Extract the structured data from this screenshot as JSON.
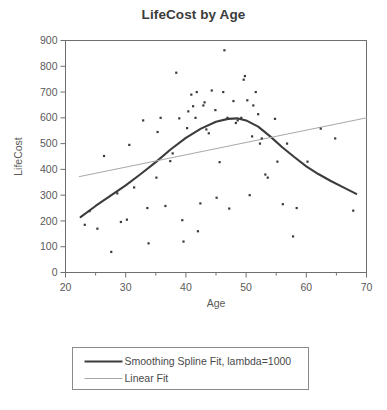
{
  "chart_data": {
    "type": "scatter",
    "title": "LifeCost by Age",
    "xlabel": "Age",
    "ylabel": "LifeCost",
    "xlim": [
      20,
      70
    ],
    "ylim": [
      0,
      900
    ],
    "xticks": [
      20,
      30,
      40,
      50,
      60,
      70
    ],
    "xminorticks": [
      25,
      35,
      45,
      55,
      65
    ],
    "yticks": [
      0,
      100,
      200,
      300,
      400,
      500,
      600,
      700,
      800,
      900
    ],
    "grid": false,
    "legend_position": "below-plot",
    "point_color": "#3a3a3a",
    "frame_color": "#6f6f6f",
    "points": [
      {
        "x": 23.2,
        "y": 185
      },
      {
        "x": 24.0,
        "y": 238
      },
      {
        "x": 25.3,
        "y": 170
      },
      {
        "x": 26.4,
        "y": 452
      },
      {
        "x": 27.6,
        "y": 80
      },
      {
        "x": 28.6,
        "y": 307
      },
      {
        "x": 29.2,
        "y": 196
      },
      {
        "x": 30.2,
        "y": 205
      },
      {
        "x": 30.6,
        "y": 495
      },
      {
        "x": 31.4,
        "y": 330
      },
      {
        "x": 32.9,
        "y": 590
      },
      {
        "x": 33.6,
        "y": 250
      },
      {
        "x": 33.8,
        "y": 113
      },
      {
        "x": 35.1,
        "y": 368
      },
      {
        "x": 35.3,
        "y": 545
      },
      {
        "x": 35.8,
        "y": 600
      },
      {
        "x": 36.6,
        "y": 258
      },
      {
        "x": 37.4,
        "y": 432
      },
      {
        "x": 37.8,
        "y": 462
      },
      {
        "x": 38.4,
        "y": 775
      },
      {
        "x": 38.9,
        "y": 598
      },
      {
        "x": 39.4,
        "y": 203
      },
      {
        "x": 39.6,
        "y": 120
      },
      {
        "x": 40.2,
        "y": 560
      },
      {
        "x": 40.4,
        "y": 625
      },
      {
        "x": 40.9,
        "y": 690
      },
      {
        "x": 41.2,
        "y": 645
      },
      {
        "x": 41.6,
        "y": 600
      },
      {
        "x": 41.8,
        "y": 700
      },
      {
        "x": 42.0,
        "y": 160
      },
      {
        "x": 42.4,
        "y": 268
      },
      {
        "x": 42.9,
        "y": 648
      },
      {
        "x": 43.1,
        "y": 660
      },
      {
        "x": 43.4,
        "y": 555
      },
      {
        "x": 43.8,
        "y": 540
      },
      {
        "x": 44.3,
        "y": 706
      },
      {
        "x": 44.9,
        "y": 630
      },
      {
        "x": 45.1,
        "y": 290
      },
      {
        "x": 45.6,
        "y": 428
      },
      {
        "x": 46.2,
        "y": 700
      },
      {
        "x": 46.4,
        "y": 862
      },
      {
        "x": 46.9,
        "y": 600
      },
      {
        "x": 47.2,
        "y": 248
      },
      {
        "x": 47.9,
        "y": 665
      },
      {
        "x": 48.3,
        "y": 580
      },
      {
        "x": 48.6,
        "y": 590
      },
      {
        "x": 49.2,
        "y": 600
      },
      {
        "x": 49.6,
        "y": 748
      },
      {
        "x": 49.8,
        "y": 762
      },
      {
        "x": 50.2,
        "y": 668
      },
      {
        "x": 50.6,
        "y": 300
      },
      {
        "x": 51.0,
        "y": 528
      },
      {
        "x": 51.2,
        "y": 648
      },
      {
        "x": 51.6,
        "y": 700
      },
      {
        "x": 52.0,
        "y": 614
      },
      {
        "x": 52.3,
        "y": 500
      },
      {
        "x": 52.6,
        "y": 520
      },
      {
        "x": 53.2,
        "y": 380
      },
      {
        "x": 53.6,
        "y": 368
      },
      {
        "x": 54.8,
        "y": 596
      },
      {
        "x": 55.2,
        "y": 430
      },
      {
        "x": 56.1,
        "y": 265
      },
      {
        "x": 56.8,
        "y": 500
      },
      {
        "x": 57.8,
        "y": 140
      },
      {
        "x": 58.4,
        "y": 250
      },
      {
        "x": 60.2,
        "y": 430
      },
      {
        "x": 62.4,
        "y": 558
      },
      {
        "x": 64.8,
        "y": 520
      },
      {
        "x": 67.8,
        "y": 240
      }
    ],
    "series": [
      {
        "name": "Smoothing Spline Fit, lambda=1000",
        "type": "line",
        "color": "#3c3c3c",
        "width": 2.1,
        "points": [
          {
            "x": 22.5,
            "y": 215
          },
          {
            "x": 25.0,
            "y": 258
          },
          {
            "x": 27.5,
            "y": 298
          },
          {
            "x": 30.0,
            "y": 338
          },
          {
            "x": 32.5,
            "y": 382
          },
          {
            "x": 35.0,
            "y": 428
          },
          {
            "x": 37.5,
            "y": 478
          },
          {
            "x": 40.0,
            "y": 522
          },
          {
            "x": 42.5,
            "y": 558
          },
          {
            "x": 45.0,
            "y": 585
          },
          {
            "x": 47.0,
            "y": 596
          },
          {
            "x": 48.5,
            "y": 598
          },
          {
            "x": 50.0,
            "y": 590
          },
          {
            "x": 52.0,
            "y": 566
          },
          {
            "x": 54.0,
            "y": 528
          },
          {
            "x": 56.0,
            "y": 486
          },
          {
            "x": 58.0,
            "y": 448
          },
          {
            "x": 60.0,
            "y": 412
          },
          {
            "x": 62.0,
            "y": 382
          },
          {
            "x": 64.0,
            "y": 356
          },
          {
            "x": 66.0,
            "y": 332
          },
          {
            "x": 68.3,
            "y": 305
          }
        ]
      },
      {
        "name": "Linear Fit",
        "type": "line",
        "color": "#a8a8a8",
        "width": 1.0,
        "points": [
          {
            "x": 22.3,
            "y": 372
          },
          {
            "x": 70.0,
            "y": 600
          }
        ]
      }
    ]
  },
  "legend": {
    "entries": [
      {
        "label": "Smoothing Spline Fit, lambda=1000",
        "color": "#3c3c3c",
        "width": 2.1
      },
      {
        "label": "Linear Fit",
        "color": "#a8a8a8",
        "width": 1.0
      }
    ]
  }
}
